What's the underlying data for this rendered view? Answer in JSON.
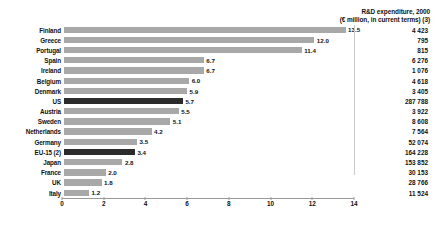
{
  "header": {
    "line1": "R&D expenditure, 2000",
    "line2": "(€ million, in current terms) (3)"
  },
  "chart_data": {
    "type": "bar",
    "title": "R&D expenditure, 2000",
    "subtitle": "(€ million, in current terms) (3)",
    "xlabel": "",
    "ylabel": "",
    "xlim": [
      0,
      14
    ],
    "xticks": [
      0,
      2,
      4,
      6,
      8,
      10,
      12,
      14
    ],
    "xtick_labels": [
      "0",
      "2",
      "4",
      "6",
      "8",
      "10",
      "12",
      "14"
    ],
    "grid": false,
    "legend": "none",
    "orientation": "horizontal",
    "colors": {
      "bar": "#a8a8a8",
      "highlight": "#2b2b2b"
    },
    "categories": [
      "Finland",
      "Greece",
      "Portugal",
      "Spain",
      "Ireland",
      "Belgium",
      "Denmark",
      "US",
      "Austria",
      "Sweden",
      "Netherlands",
      "Germany",
      "EU-15 (2)",
      "Japan",
      "France",
      "UK",
      "Italy"
    ],
    "values": [
      13.5,
      12.0,
      11.4,
      6.7,
      6.7,
      6.0,
      5.9,
      5.7,
      5.5,
      5.1,
      4.2,
      3.5,
      3.4,
      2.8,
      2.0,
      1.8,
      1.2
    ],
    "value_labels": [
      "13.5",
      "12.0",
      "11.4",
      "6.7",
      "6.7",
      "6.0",
      "5.9",
      "5.7",
      "5.5",
      "5.1",
      "4.2",
      "3.5",
      "3.4",
      "2.8",
      "2.0",
      "1.8",
      "1.2"
    ],
    "highlighted": [
      "US",
      "EU-15 (2)"
    ],
    "side_column_header": "R&D expenditure, 2000 (€ million, in current terms) (3)",
    "side_column_values": [
      "4 423",
      "795",
      "815",
      "6 276",
      "1 076",
      "4 618",
      "3 405",
      "287 788",
      "3 922",
      "8 608",
      "7 564",
      "52 074",
      "164 228",
      "153 852",
      "30 153",
      "28 766",
      "11 524"
    ]
  }
}
